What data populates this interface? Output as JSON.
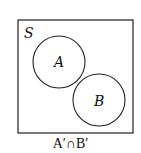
{
  "diagram": {
    "type": "venn",
    "universe_label": "S",
    "sets": [
      {
        "label": "A"
      },
      {
        "label": "B"
      }
    ],
    "relationship": "disjoint",
    "caption": "A′∩B′",
    "colors": {
      "stroke": "#222222",
      "background": "#ffffff"
    }
  }
}
